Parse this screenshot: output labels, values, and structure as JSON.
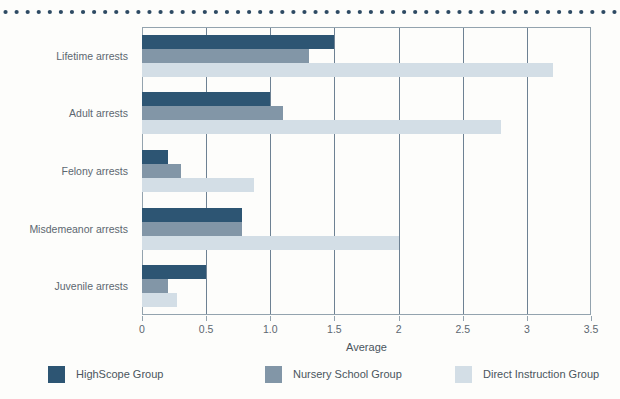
{
  "decor": {
    "dotted_rule_color": "#2d4a63",
    "dot_count": 56
  },
  "chart_data": {
    "type": "bar",
    "orientation": "horizontal",
    "title": "",
    "xlabel": "Average",
    "ylabel": "",
    "xlim": [
      0,
      3.5
    ],
    "xticks": [
      0,
      0.5,
      1.0,
      1.5,
      2,
      2.5,
      3,
      3.5
    ],
    "xtick_labels": [
      "0",
      "0.5",
      "1.0",
      "1.5",
      "2",
      "2.5",
      "3",
      "3.5"
    ],
    "grid": true,
    "legend_position": "bottom",
    "categories": [
      "Lifetime arrests",
      "Adult arrests",
      "Felony arrests",
      "Misdemeanor arrests",
      "Juvenile arrests"
    ],
    "series": [
      {
        "name": "HighScope Group",
        "color": "#2d5573",
        "values": [
          1.5,
          1.0,
          0.2,
          0.78,
          0.5
        ]
      },
      {
        "name": "Nursery School Group",
        "color": "#8296a7",
        "values": [
          1.3,
          1.1,
          0.3,
          0.78,
          0.2
        ]
      },
      {
        "name": "Direct Instruction Group",
        "color": "#d3dee6",
        "values": [
          3.2,
          2.8,
          0.87,
          2.0,
          0.27
        ]
      }
    ]
  }
}
